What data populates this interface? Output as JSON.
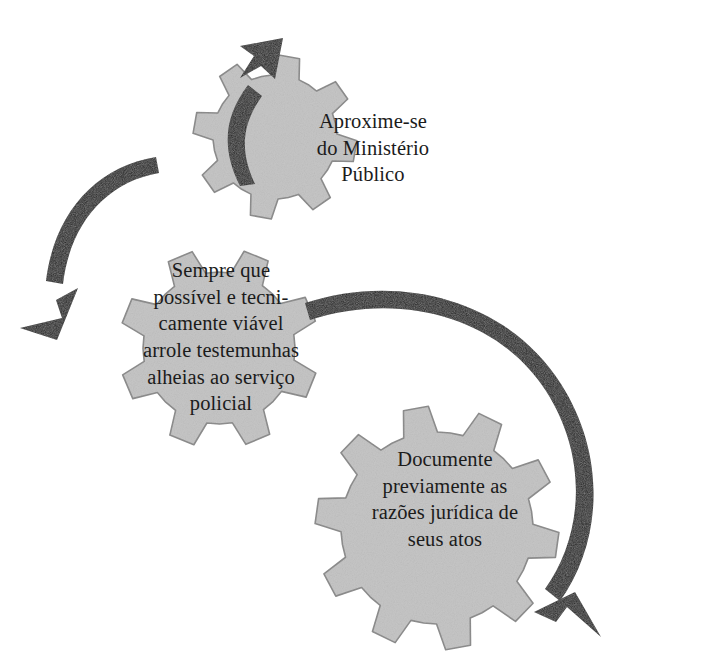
{
  "figure": {
    "background_color": "#ffffff",
    "gear_fill_color": "#c6c6c6",
    "gear_stroke_color": "#8f8f8f",
    "arrow_color": "#1f1f1f",
    "text_color": "#1b1b1b",
    "clipped_caption_fragment": "",
    "gears": [
      {
        "id": "gear-top",
        "name": "gear-aproxime-se",
        "label": "Aproxime-se\ndo Ministério\nPúblico",
        "lines": [
          "Aproxime-se",
          "do Ministério",
          "Público"
        ],
        "center_x": 275,
        "center_y": 137,
        "outer_radius": 82,
        "inner_radius": 62,
        "teeth": 8,
        "rotation_deg": 10
      },
      {
        "id": "gear-left",
        "name": "gear-sempre-que-possivel",
        "label": "Sempre que\npossível e tecni-\ncamente viável\narrole testemunhas\nalheias ao serviço\npolicial",
        "lines": [
          "Sempre que",
          "possível e tecni-",
          "camente viável",
          "arrole testemunhas",
          "alheias ao serviço",
          "policial"
        ],
        "center_x": 219,
        "center_y": 348,
        "outer_radius": 100,
        "inner_radius": 76,
        "teeth": 8,
        "rotation_deg": 22
      },
      {
        "id": "gear-bottom",
        "name": "gear-documente-previamente",
        "label": "Documente\npreviamente as\nrazões jurídica de\nseus atos",
        "lines": [
          "Documente",
          "previamente as",
          "razões jurídica de",
          "seus atos"
        ],
        "center_x": 437,
        "center_y": 528,
        "outer_radius": 122,
        "inner_radius": 96,
        "teeth": 10,
        "rotation_deg": 8
      }
    ],
    "arrows": [
      {
        "id": "arrow-up-right",
        "name": "arrow-to-gear-top",
        "direction": "up-right",
        "from": "gear-left",
        "to": "gear-top"
      },
      {
        "id": "arrow-down-left",
        "name": "arrow-from-gear-top-outward",
        "direction": "down-left",
        "from": "gear-top",
        "to": "outward-left"
      },
      {
        "id": "arrow-right-down",
        "name": "arrow-around-gear-bottom",
        "direction": "clockwise-down",
        "from": "gear-left",
        "to": "gear-bottom"
      }
    ]
  }
}
